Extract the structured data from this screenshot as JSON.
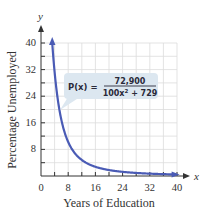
{
  "chart_data": {
    "type": "line",
    "title": "",
    "xlabel": "Years of Education",
    "ylabel": "Percentage Unemployed",
    "x_axis_letter": "x",
    "y_axis_letter": "y",
    "xlim": [
      0,
      40
    ],
    "ylim": [
      0,
      40
    ],
    "x_ticks": [
      0,
      8,
      16,
      24,
      32,
      40
    ],
    "y_ticks": [
      8,
      16,
      24,
      32,
      40
    ],
    "grid": true,
    "grid_step": 4,
    "function": "P(x) = 72,900 / (100x^2 + 729)",
    "series": [
      {
        "name": "P(x)",
        "color": "#4a5bb5",
        "x": [
          1,
          2,
          3,
          4,
          5,
          6,
          8,
          10,
          12,
          16,
          20,
          24,
          28,
          32,
          36,
          40
        ],
        "values": [
          87.8,
          46.9,
          35.6,
          11.5,
          7.8,
          5.0,
          8.9,
          6.3,
          4.6,
          2.7,
          1.8,
          1.2,
          0.9,
          0.7,
          0.6,
          0.5
        ]
      }
    ],
    "annotations": [
      {
        "text": "P(x) = 72,900 / (100x² + 729)",
        "position": "callout box near curve around x≈8, y≈24"
      }
    ]
  },
  "labels": {
    "y_letter": "y",
    "x_letter": "x",
    "x_title": "Years of Education",
    "y_title": "Percentage Unemployed",
    "x_ticks": [
      "0",
      "8",
      "16",
      "24",
      "32",
      "40"
    ],
    "y_ticks": [
      "8",
      "16",
      "24",
      "32",
      "40"
    ],
    "formula_lhs": "P(x) =",
    "formula_num": "72,900",
    "formula_den_a": "100x",
    "formula_den_exp": "2",
    "formula_den_b": " + 729"
  },
  "colors": {
    "curve": "#4a5bb5",
    "grid": "#dcdcdc",
    "callout_fill": "#dce7f0",
    "axis": "#333333"
  }
}
